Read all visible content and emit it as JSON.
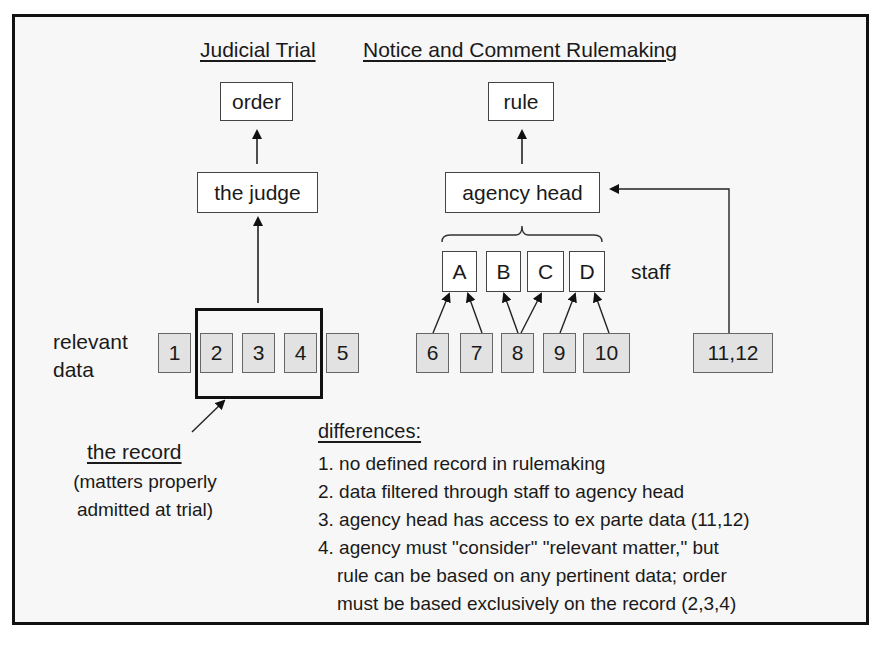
{
  "headings": {
    "judicial": "Judicial Trial",
    "rulemaking": "Notice and Comment Rulemaking"
  },
  "judicial": {
    "output": "order",
    "decider": "the judge",
    "data_label": [
      "relevant",
      "data"
    ],
    "data_items": [
      "1",
      "2",
      "3",
      "4",
      "5"
    ],
    "record_items": [
      "2",
      "3",
      "4"
    ],
    "record_label": "the record",
    "record_note": [
      "(matters properly",
      "admitted at trial)"
    ]
  },
  "rulemaking": {
    "output": "rule",
    "decider": "agency head",
    "staff_label": "staff",
    "staff": [
      "A",
      "B",
      "C",
      "D"
    ],
    "data_items": [
      "6",
      "7",
      "8",
      "9",
      "10"
    ],
    "ex_parte": "11,12",
    "flows": [
      {
        "from": "6",
        "to": "A"
      },
      {
        "from": "7",
        "to": "A"
      },
      {
        "from": "8",
        "to": "B"
      },
      {
        "from": "8",
        "to": "C"
      },
      {
        "from": "9",
        "to": "D"
      },
      {
        "from": "10",
        "to": "D"
      },
      {
        "from": "11,12",
        "to": "agency head"
      }
    ]
  },
  "differences": {
    "title": "differences:",
    "items": [
      "1. no defined record in rulemaking",
      "2. data filtered through staff to agency head",
      "3. agency head has access to ex parte data (11,12)",
      "4. agency must \"consider\" \"relevant matter,\" but",
      "rule can be based on any pertinent data;  order",
      "must be based exclusively on the record (2,3,4)"
    ]
  }
}
